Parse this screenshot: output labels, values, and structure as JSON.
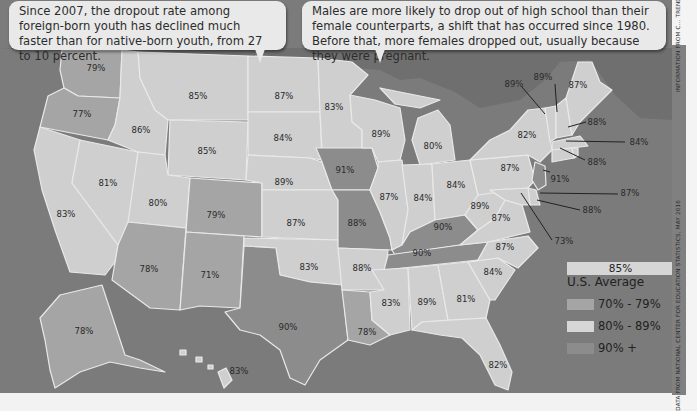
{
  "callouts": [
    {
      "text": "Since 2007, the dropout rate among foreign-born youth has declined much faster than for native-born youth, from 27 to 10 percent."
    },
    {
      "text": "Males are more likely to drop out of high school than their female counterparts, a shift that has occurred since 1980. Before that, more females dropped out, usually because they were pregnant."
    }
  ],
  "legend": {
    "average_value": "85%",
    "average_label": "U.S. Average",
    "items": [
      {
        "label": "70% - 79%",
        "color": "#a5a5a5"
      },
      {
        "label": "80% - 89%",
        "color": "#cfcfcf"
      },
      {
        "label": "90% +",
        "color": "#8c8c8c"
      }
    ]
  },
  "credits": {
    "top": "INFORMATION FROM C... TRENDS DATABANK, 20...",
    "bottom": "DATA FROM NATIONAL CENTER FOR EDUCATION STATISTICS, MAY 2016"
  },
  "map_data": {
    "type": "choropleth",
    "metric": "High school graduation rate by state",
    "colors": {
      "70-79": "#a5a5a5",
      "80-89": "#cfcfcf",
      "90+": "#8c8c8c",
      "water": "#7b7b7b"
    },
    "states": [
      {
        "state": "WA",
        "value": "79%"
      },
      {
        "state": "OR",
        "value": "77%"
      },
      {
        "state": "CA",
        "value": "83%"
      },
      {
        "state": "NV",
        "value": "81%"
      },
      {
        "state": "ID",
        "value": "86%"
      },
      {
        "state": "MT",
        "value": "85%"
      },
      {
        "state": "WY",
        "value": "85%"
      },
      {
        "state": "UT",
        "value": "80%"
      },
      {
        "state": "CO",
        "value": "79%"
      },
      {
        "state": "AZ",
        "value": "78%"
      },
      {
        "state": "NM",
        "value": "71%"
      },
      {
        "state": "ND",
        "value": "87%"
      },
      {
        "state": "SD",
        "value": "84%"
      },
      {
        "state": "NE",
        "value": "89%"
      },
      {
        "state": "KS",
        "value": "87%"
      },
      {
        "state": "OK",
        "value": "83%"
      },
      {
        "state": "TX",
        "value": "90%"
      },
      {
        "state": "MN",
        "value": "83%"
      },
      {
        "state": "IA",
        "value": "91%"
      },
      {
        "state": "MO",
        "value": "88%"
      },
      {
        "state": "AR",
        "value": "88%"
      },
      {
        "state": "LA",
        "value": "78%"
      },
      {
        "state": "WI",
        "value": "89%"
      },
      {
        "state": "IL",
        "value": "87%"
      },
      {
        "state": "MI",
        "value": "80%"
      },
      {
        "state": "IN",
        "value": "84%"
      },
      {
        "state": "OH",
        "value": "84%"
      },
      {
        "state": "KY",
        "value": "90%"
      },
      {
        "state": "TN",
        "value": "90%"
      },
      {
        "state": "MS",
        "value": "83%"
      },
      {
        "state": "AL",
        "value": "89%"
      },
      {
        "state": "GA",
        "value": "81%"
      },
      {
        "state": "FL",
        "value": "82%"
      },
      {
        "state": "SC",
        "value": "84%"
      },
      {
        "state": "NC",
        "value": "87%"
      },
      {
        "state": "VA",
        "value": "87%"
      },
      {
        "state": "WV",
        "value": "89%"
      },
      {
        "state": "PA",
        "value": "87%"
      },
      {
        "state": "NY",
        "value": "82%"
      },
      {
        "state": "VT",
        "value": "89%"
      },
      {
        "state": "NH",
        "value": "89%"
      },
      {
        "state": "ME",
        "value": "87%"
      },
      {
        "state": "MA",
        "value": "88%"
      },
      {
        "state": "RI",
        "value": "84%"
      },
      {
        "state": "CT",
        "value": "88%"
      },
      {
        "state": "NJ",
        "value": "91%"
      },
      {
        "state": "DE",
        "value": "87%"
      },
      {
        "state": "MD",
        "value": "88%"
      },
      {
        "state": "DC",
        "value": "73%"
      },
      {
        "state": "AK",
        "value": "78%"
      },
      {
        "state": "HI",
        "value": "83%"
      }
    ]
  }
}
